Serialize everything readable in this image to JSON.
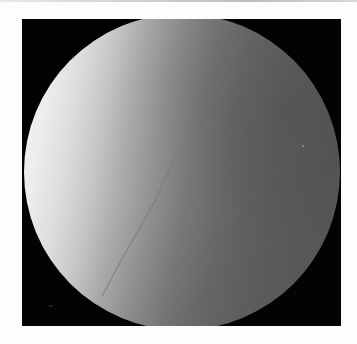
{
  "image": {
    "kind": "fluoroscopy-frame",
    "description": "Circular grayscale fluoroscopic field of view on a black square background, bright on the left fading to dark gray on the right, with a faint thin diagonal line (guidewire) in the lower-left region",
    "colors": {
      "page_background": "#fdfdfd",
      "frame_background": "#030303",
      "field_bright": "#f4f4f4",
      "field_dark": "#555555",
      "guidewire": "#7a7a7a"
    },
    "text_labels": []
  }
}
